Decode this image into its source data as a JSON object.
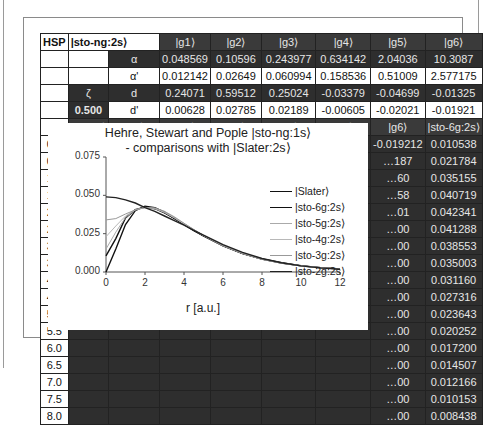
{
  "sheet": {
    "header": {
      "hsp": "HSP",
      "basis": "|sto-ng:2s⟩",
      "g": [
        "|g1⟩",
        "|g2⟩",
        "|g3⟩",
        "|g4⟩",
        "|g5⟩",
        "|g6⟩"
      ]
    },
    "params": [
      {
        "label": "α",
        "values": [
          "0.048569",
          "0.10596",
          "0.243977",
          "0.634142",
          "2.04036",
          "10.3087"
        ]
      },
      {
        "label": "α'",
        "values": [
          "0.012142",
          "0.02649",
          "0.060994",
          "0.158536",
          "0.51009",
          "2.577175"
        ]
      },
      {
        "zeta_label": "ζ",
        "label": "d",
        "values": [
          "0.24071",
          "0.59512",
          "0.25024",
          "-0.03379",
          "-0.04699",
          "-0.01325"
        ]
      },
      {
        "zeta_value": "0.500",
        "label": "d'",
        "values": [
          "0.00628",
          "0.02785",
          "0.02189",
          "-0.00605",
          "-0.02021",
          "-0.01921"
        ]
      }
    ],
    "col_headers": [
      "r",
      "|Slater⟩",
      "|g1⟩",
      "|g2⟩",
      "|g3⟩",
      "|g4⟩",
      "|g5⟩",
      "|g6⟩",
      "|sto-6g:2s⟩"
    ],
    "rows": [
      {
        "r": "0.0",
        "cells": [
          "0.0000",
          "0.006275",
          "0.027850",
          "0.021890",
          "-0.006050",
          "-0.020215",
          "-0.019212",
          "0.010538"
        ]
      },
      {
        "r": "0.5",
        "cells": [
          "",
          "",
          "",
          "",
          "",
          "",
          "…187",
          "0.021784"
        ]
      },
      {
        "r": "1.0",
        "cells": [
          "",
          "",
          "",
          "",
          "",
          "",
          "…60",
          "0.035155"
        ]
      },
      {
        "r": "1.5",
        "cells": [
          "",
          "",
          "",
          "",
          "",
          "",
          "…58",
          "0.040719"
        ]
      },
      {
        "r": "2.0",
        "cells": [
          "",
          "",
          "",
          "",
          "",
          "",
          "…01",
          "0.042341"
        ]
      },
      {
        "r": "2.5",
        "cells": [
          "",
          "",
          "",
          "",
          "",
          "",
          "…00",
          "0.041288"
        ]
      },
      {
        "r": "3.0",
        "cells": [
          "",
          "",
          "",
          "",
          "",
          "",
          "…00",
          "0.038553"
        ]
      },
      {
        "r": "3.5",
        "cells": [
          "",
          "",
          "",
          "",
          "",
          "",
          "…00",
          "0.035003"
        ]
      },
      {
        "r": "4.0",
        "cells": [
          "",
          "",
          "",
          "",
          "",
          "",
          "…00",
          "0.031160"
        ]
      },
      {
        "r": "4.5",
        "cells": [
          "",
          "",
          "",
          "",
          "",
          "",
          "…00",
          "0.027316"
        ]
      },
      {
        "r": "5.0",
        "cells": [
          "",
          "",
          "",
          "",
          "",
          "",
          "…00",
          "0.023643"
        ]
      },
      {
        "r": "5.5",
        "cells": [
          "",
          "",
          "",
          "",
          "",
          "",
          "…00",
          "0.020252"
        ]
      },
      {
        "r": "6.0",
        "cells": [
          "",
          "",
          "",
          "",
          "",
          "",
          "…00",
          "0.017200"
        ]
      },
      {
        "r": "6.5",
        "cells": [
          "",
          "",
          "",
          "",
          "",
          "",
          "…00",
          "0.014507"
        ]
      },
      {
        "r": "7.0",
        "cells": [
          "",
          "",
          "",
          "",
          "",
          "",
          "…00",
          "0.012166"
        ]
      },
      {
        "r": "7.5",
        "cells": [
          "",
          "",
          "",
          "",
          "",
          "",
          "…00",
          "0.010153"
        ]
      },
      {
        "r": "8.0",
        "cells": [
          "",
          "",
          "",
          "",
          "",
          "",
          "…00",
          "0.008438"
        ]
      }
    ]
  },
  "chart_data": {
    "type": "line",
    "title": "Hehre, Stewart and Pople |sto-ng:1s⟩",
    "subtitle": "- comparisons with |Slater:2s⟩",
    "xlabel": "r [a.u.]",
    "ylabel": "",
    "xlim": [
      0,
      12
    ],
    "ylim": [
      0,
      0.075
    ],
    "xticks": [
      "0",
      "2",
      "4",
      "6",
      "8",
      "10",
      "12"
    ],
    "yticks": [
      "0.000",
      "0.025",
      "0.050",
      "0.075"
    ],
    "legend_position": "right",
    "x": [
      0,
      0.5,
      1,
      1.5,
      2,
      2.5,
      3,
      3.5,
      4,
      4.5,
      5,
      6,
      7,
      8,
      9,
      10,
      11,
      12
    ],
    "series": [
      {
        "name": "|Slater⟩",
        "color": "#111111",
        "values": [
          0.0,
          0.015,
          0.031,
          0.04,
          0.043,
          0.042,
          0.039,
          0.035,
          0.031,
          0.027,
          0.0235,
          0.017,
          0.012,
          0.0085,
          0.006,
          0.0042,
          0.0029,
          0.002
        ]
      },
      {
        "name": "|sto-6g:2s⟩",
        "color": "#111111",
        "values": [
          0.0105,
          0.0218,
          0.0352,
          0.0407,
          0.0423,
          0.0413,
          0.0386,
          0.035,
          0.0312,
          0.0273,
          0.0236,
          0.0172,
          0.0122,
          0.0084,
          0.0058,
          0.004,
          0.0028,
          0.002
        ]
      },
      {
        "name": "|sto-5g:2s⟩",
        "color": "#aaaaaa",
        "values": [
          0.015,
          0.026,
          0.0355,
          0.0405,
          0.0422,
          0.0414,
          0.0388,
          0.0352,
          0.0313,
          0.0274,
          0.0237,
          0.0172,
          0.0122,
          0.0084,
          0.0058,
          0.004,
          0.0028,
          0.002
        ]
      },
      {
        "name": "|sto-4g:2s⟩",
        "color": "#b8b8b8",
        "values": [
          0.023,
          0.03,
          0.0365,
          0.0405,
          0.042,
          0.0415,
          0.039,
          0.0355,
          0.0315,
          0.0275,
          0.0238,
          0.0172,
          0.0122,
          0.0084,
          0.0058,
          0.004,
          0.0028,
          0.002
        ]
      },
      {
        "name": "|sto-3g:2s⟩",
        "color": "#999999",
        "values": [
          0.034,
          0.0348,
          0.0378,
          0.0405,
          0.042,
          0.0418,
          0.0396,
          0.036,
          0.0318,
          0.0277,
          0.0238,
          0.0172,
          0.0121,
          0.0083,
          0.0057,
          0.004,
          0.0028,
          0.002
        ]
      },
      {
        "name": "|sto-2g:2s⟩",
        "color": "#222222",
        "values": [
          0.049,
          0.0485,
          0.047,
          0.045,
          0.042,
          0.0395,
          0.0365,
          0.0335,
          0.0305,
          0.0272,
          0.024,
          0.0178,
          0.0128,
          0.0088,
          0.006,
          0.004,
          0.0027,
          0.0018
        ]
      }
    ]
  }
}
